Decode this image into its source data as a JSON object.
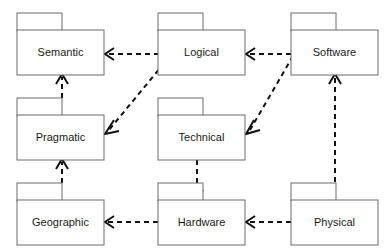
{
  "diagram": {
    "type": "uml-package-diagram",
    "title": "",
    "canvas": {
      "width": 392,
      "height": 252
    },
    "style": {
      "package_fill": "#ffffff",
      "package_stroke": "#6b6b6b",
      "label_color": "#1a1a1a",
      "arrow_color": "#111111",
      "arrow_style": "dashed-dependency",
      "background": "#ffffff"
    },
    "packages": [
      {
        "id": "semantic",
        "label": "Semantic",
        "x": 17,
        "y": 13,
        "tab_w": 45,
        "tab_h": 17,
        "body_w": 87,
        "body_h": 45
      },
      {
        "id": "logical",
        "label": "Logical",
        "x": 158,
        "y": 13,
        "tab_w": 45,
        "tab_h": 17,
        "body_w": 87,
        "body_h": 45
      },
      {
        "id": "software",
        "label": "Software",
        "x": 291,
        "y": 13,
        "tab_w": 45,
        "tab_h": 17,
        "body_w": 87,
        "body_h": 45
      },
      {
        "id": "pragmatic",
        "label": "Pragmatic",
        "x": 17,
        "y": 98,
        "tab_w": 45,
        "tab_h": 17,
        "body_w": 87,
        "body_h": 45
      },
      {
        "id": "technical",
        "label": "Technical",
        "x": 158,
        "y": 98,
        "tab_w": 45,
        "tab_h": 17,
        "body_w": 87,
        "body_h": 45
      },
      {
        "id": "geographic",
        "label": "Geographic",
        "x": 17,
        "y": 183,
        "tab_w": 45,
        "tab_h": 17,
        "body_w": 87,
        "body_h": 45
      },
      {
        "id": "hardware",
        "label": "Hardware",
        "x": 158,
        "y": 183,
        "tab_w": 45,
        "tab_h": 17,
        "body_w": 87,
        "body_h": 45
      },
      {
        "id": "physical",
        "label": "Physical",
        "x": 291,
        "y": 183,
        "tab_w": 45,
        "tab_h": 17,
        "body_w": 87,
        "body_h": 45
      }
    ],
    "dependencies": [
      {
        "id": "logical-to-semantic",
        "from": "logical",
        "to": "semantic",
        "x1": 168,
        "y1": 54,
        "x2": 106,
        "y2": 54,
        "direction": "left"
      },
      {
        "id": "software-to-logical",
        "from": "software",
        "to": "logical",
        "x1": 291,
        "y1": 54,
        "x2": 247,
        "y2": 54,
        "direction": "left"
      },
      {
        "id": "logical-to-pragmatic",
        "from": "logical",
        "to": "pragmatic",
        "x1": 170,
        "y1": 56,
        "x2": 106,
        "y2": 133,
        "direction": "down-left"
      },
      {
        "id": "software-to-technical",
        "from": "software",
        "to": "technical",
        "x1": 293,
        "y1": 56,
        "x2": 247,
        "y2": 133,
        "direction": "down-left"
      },
      {
        "id": "pragmatic-to-semantic",
        "from": "pragmatic",
        "to": "semantic",
        "x1": 62,
        "y1": 98,
        "x2": 62,
        "y2": 74,
        "direction": "up"
      },
      {
        "id": "geographic-to-pragmatic",
        "from": "geographic",
        "to": "pragmatic",
        "x1": 62,
        "y1": 183,
        "x2": 62,
        "y2": 159,
        "direction": "up"
      },
      {
        "id": "technical-to-hardware",
        "from": "technical",
        "to": "hardware",
        "x1": 197,
        "y1": 160,
        "x2": 197,
        "y2": 200,
        "direction": "down"
      },
      {
        "id": "physical-to-software",
        "from": "physical",
        "to": "software",
        "x1": 335,
        "y1": 200,
        "x2": 335,
        "y2": 74,
        "direction": "up"
      },
      {
        "id": "hardware-to-geographic",
        "from": "hardware",
        "to": "geographic",
        "x1": 158,
        "y1": 222,
        "x2": 106,
        "y2": 222,
        "direction": "left"
      },
      {
        "id": "physical-to-hardware",
        "from": "physical",
        "to": "hardware",
        "x1": 291,
        "y1": 222,
        "x2": 247,
        "y2": 222,
        "direction": "left"
      }
    ]
  }
}
